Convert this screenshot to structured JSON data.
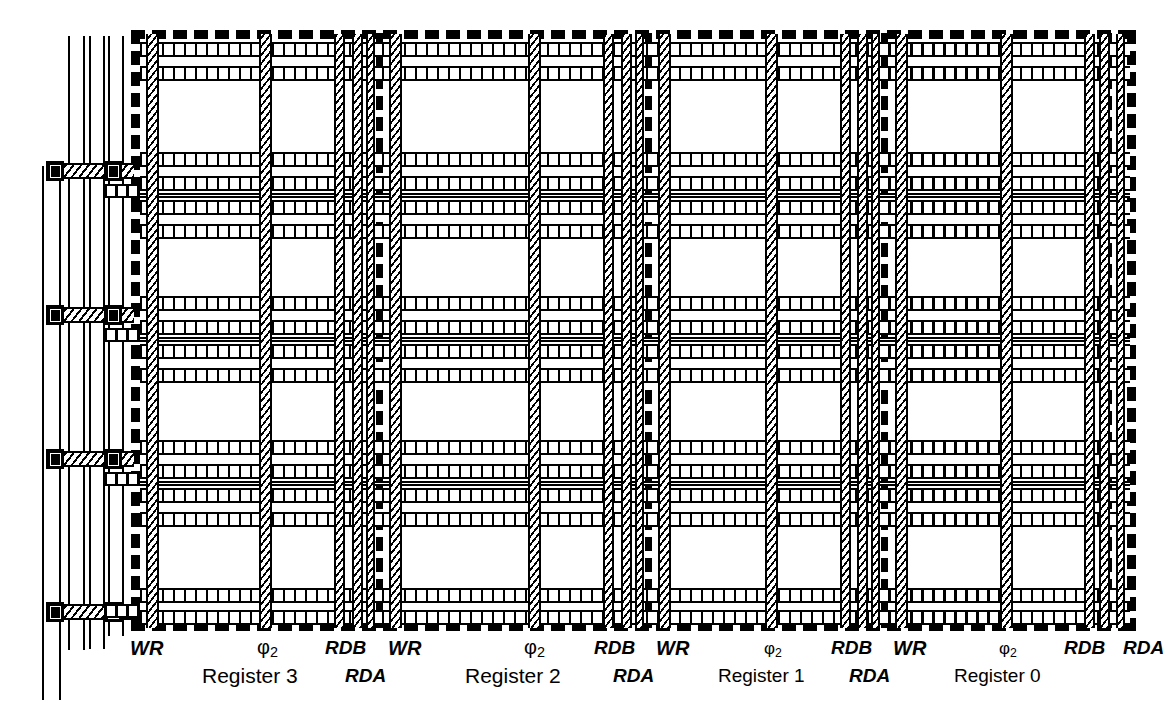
{
  "diagram": {
    "kind": "vlsi-mask-layout",
    "registers": [
      {
        "name": "Register 3",
        "wr": "WR",
        "clk": "φ2",
        "rdb": "RDB",
        "rda": "RDA"
      },
      {
        "name": "Register 2",
        "wr": "WR",
        "clk": "φ2",
        "rdb": "RDB",
        "rda": "RDA"
      },
      {
        "name": "Register 1",
        "wr": "WR",
        "clk": "φ2",
        "rdb": "RDB",
        "rda": "RDA"
      },
      {
        "name": "Register 0",
        "wr": "WR",
        "clk": "φ2",
        "rdb": "RDB",
        "rda": "RDA"
      }
    ],
    "labels": {
      "wr": "WR",
      "clk_base": "φ",
      "clk_sub": "2",
      "rdb": "RDB",
      "rda": "RDA"
    },
    "layers": {
      "diffusion": "#000000",
      "polysilicon": "#000000",
      "metal": "#000000",
      "contact": "#000000",
      "background": "#ffffff"
    },
    "legend_names": [
      "diffusion-ladder-band",
      "polysilicon-hatched-band",
      "metal-dashed-band",
      "contact-cut"
    ]
  }
}
